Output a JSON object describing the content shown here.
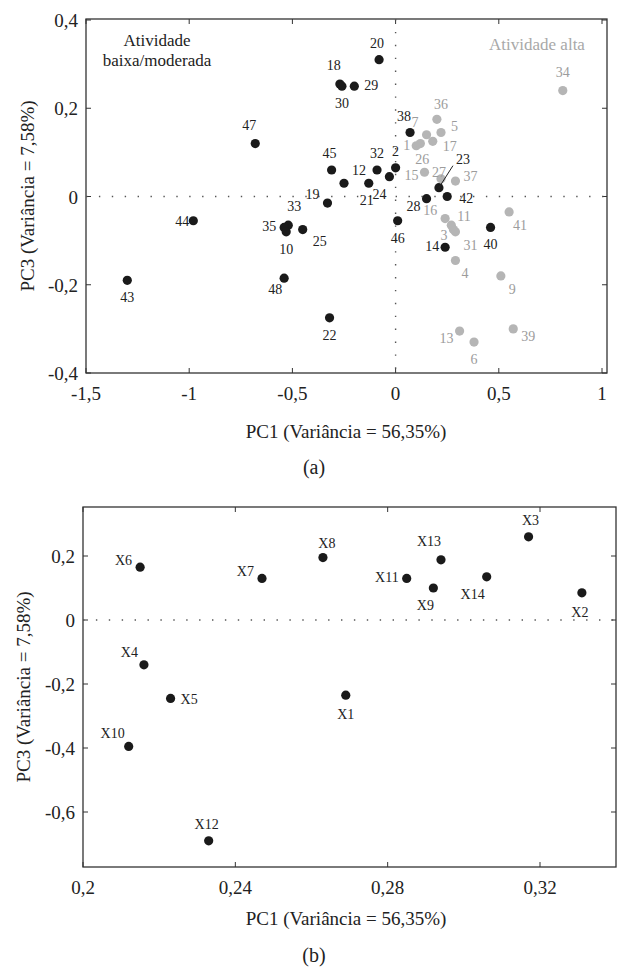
{
  "chart_data": [
    {
      "panel": "(a)",
      "type": "scatter",
      "title": "",
      "xlabel": "PC1 (Variância = 56,35%)",
      "ylabel": "PC3 (Variância = 7,58%)",
      "xlim": [
        -1.5,
        1.05
      ],
      "ylim": [
        -0.4,
        0.4
      ],
      "xticks": [
        "-1,5",
        "-1",
        "-0,5",
        "0",
        "0,5",
        "1"
      ],
      "yticks": [
        "0,4",
        "0,2",
        "0",
        "-0,2",
        "-0,4"
      ],
      "grid": false,
      "reference_lines": [
        "x=0 dotted",
        "y=0 dotted"
      ],
      "annotations": [
        "Atividade baixa/moderada",
        "Atividade alta"
      ],
      "series": [
        {
          "name": "Atividade baixa/moderada",
          "color": "#1a1a1a",
          "points": [
            {
              "label": "20",
              "x": -0.08,
              "y": 0.31
            },
            {
              "label": "18",
              "x": -0.27,
              "y": 0.255
            },
            {
              "label": "30",
              "x": -0.26,
              "y": 0.25
            },
            {
              "label": "29",
              "x": -0.2,
              "y": 0.25
            },
            {
              "label": "47",
              "x": -0.68,
              "y": 0.12
            },
            {
              "label": "38",
              "x": 0.07,
              "y": 0.145
            },
            {
              "label": "45",
              "x": -0.31,
              "y": 0.06
            },
            {
              "label": "12",
              "x": -0.25,
              "y": 0.03
            },
            {
              "label": "32",
              "x": -0.09,
              "y": 0.06
            },
            {
              "label": "2",
              "x": 0.0,
              "y": 0.065
            },
            {
              "label": "24",
              "x": -0.03,
              "y": 0.045
            },
            {
              "label": "21",
              "x": -0.13,
              "y": 0.03
            },
            {
              "label": "19",
              "x": -0.33,
              "y": -0.015
            },
            {
              "label": "23",
              "x": 0.21,
              "y": 0.02
            },
            {
              "label": "42",
              "x": 0.25,
              "y": 0.0
            },
            {
              "label": "28",
              "x": 0.15,
              "y": -0.005
            },
            {
              "label": "46",
              "x": 0.01,
              "y": -0.055
            },
            {
              "label": "44",
              "x": -0.98,
              "y": -0.055
            },
            {
              "label": "33",
              "x": -0.52,
              "y": -0.065
            },
            {
              "label": "35",
              "x": -0.54,
              "y": -0.07
            },
            {
              "label": "10",
              "x": -0.53,
              "y": -0.08
            },
            {
              "label": "25",
              "x": -0.45,
              "y": -0.075
            },
            {
              "label": "40",
              "x": 0.46,
              "y": -0.07
            },
            {
              "label": "14",
              "x": 0.24,
              "y": -0.115
            },
            {
              "label": "43",
              "x": -1.3,
              "y": -0.19
            },
            {
              "label": "48",
              "x": -0.54,
              "y": -0.185
            },
            {
              "label": "22",
              "x": -0.32,
              "y": -0.275
            }
          ]
        },
        {
          "name": "Atividade alta",
          "color": "#b5b5b5",
          "points": [
            {
              "label": "34",
              "x": 0.81,
              "y": 0.24
            },
            {
              "label": "36",
              "x": 0.2,
              "y": 0.175
            },
            {
              "label": "7",
              "x": 0.15,
              "y": 0.14
            },
            {
              "label": "5",
              "x": 0.22,
              "y": 0.145
            },
            {
              "label": "17",
              "x": 0.18,
              "y": 0.125
            },
            {
              "label": "1",
              "x": 0.1,
              "y": 0.115
            },
            {
              "label": "26",
              "x": 0.12,
              "y": 0.12
            },
            {
              "label": "15",
              "x": 0.14,
              "y": 0.055
            },
            {
              "label": "27",
              "x": 0.22,
              "y": 0.04
            },
            {
              "label": "37",
              "x": 0.29,
              "y": 0.035
            },
            {
              "label": "16",
              "x": 0.24,
              "y": -0.05
            },
            {
              "label": "11",
              "x": 0.27,
              "y": -0.065
            },
            {
              "label": "3",
              "x": 0.28,
              "y": -0.075
            },
            {
              "label": "31",
              "x": 0.29,
              "y": -0.08
            },
            {
              "label": "41",
              "x": 0.55,
              "y": -0.035
            },
            {
              "label": "4",
              "x": 0.29,
              "y": -0.145
            },
            {
              "label": "9",
              "x": 0.51,
              "y": -0.18
            },
            {
              "label": "13",
              "x": 0.31,
              "y": -0.305
            },
            {
              "label": "6",
              "x": 0.38,
              "y": -0.33
            },
            {
              "label": "39",
              "x": 0.57,
              "y": -0.3
            }
          ]
        }
      ]
    },
    {
      "panel": "(b)",
      "type": "scatter",
      "title": "",
      "xlabel": "PC1 (Variância = 56,35%)",
      "ylabel": "PC3 (Variância = 7,58%)",
      "xlim": [
        0.2,
        0.34
      ],
      "ylim": [
        -0.77,
        0.35
      ],
      "xticks": [
        "0,2",
        "0,24",
        "0,28",
        "0,32"
      ],
      "yticks": [
        "0,2",
        "0",
        "-0,2",
        "-0,4",
        "-0,6"
      ],
      "grid": false,
      "reference_lines": [
        "y=0 dotted"
      ],
      "series": [
        {
          "name": "Variáveis",
          "color": "#1a1a1a",
          "points": [
            {
              "label": "X1",
              "x": 0.269,
              "y": -0.235
            },
            {
              "label": "X2",
              "x": 0.331,
              "y": 0.085
            },
            {
              "label": "X3",
              "x": 0.317,
              "y": 0.26
            },
            {
              "label": "X4",
              "x": 0.216,
              "y": -0.14
            },
            {
              "label": "X5",
              "x": 0.223,
              "y": -0.245
            },
            {
              "label": "X6",
              "x": 0.215,
              "y": 0.165
            },
            {
              "label": "X7",
              "x": 0.247,
              "y": 0.13
            },
            {
              "label": "X8",
              "x": 0.263,
              "y": 0.195
            },
            {
              "label": "X9",
              "x": 0.292,
              "y": 0.1
            },
            {
              "label": "X10",
              "x": 0.212,
              "y": -0.395
            },
            {
              "label": "X11",
              "x": 0.285,
              "y": 0.13
            },
            {
              "label": "X12",
              "x": 0.233,
              "y": -0.69
            },
            {
              "label": "X13",
              "x": 0.294,
              "y": 0.188
            },
            {
              "label": "X14",
              "x": 0.306,
              "y": 0.135
            }
          ]
        }
      ]
    }
  ],
  "figure": {
    "panel_a": {
      "caption": "(a)",
      "xlabel": "PC1 (Variância = 56,35%)",
      "ylabel": "PC3 (Variância = 7,58%)",
      "annotation_left_line1": "Atividade",
      "annotation_left_line2": "baixa/moderada",
      "annotation_right": "Atividade alta",
      "xticks": [
        "-1,5",
        "-1",
        "-0,5",
        "0",
        "0,5",
        "1"
      ],
      "yticks": [
        "0,4",
        "0,2",
        "0",
        "-0,2",
        "-0,4"
      ]
    },
    "panel_b": {
      "caption": "(b)",
      "xlabel": "PC1 (Variância = 56,35%)",
      "ylabel": "PC3 (Variância = 7,58%)",
      "xticks": [
        "0,2",
        "0,24",
        "0,28",
        "0,32"
      ],
      "yticks": [
        "0,2",
        "0",
        "-0,2",
        "-0,4",
        "-0,6"
      ]
    }
  }
}
